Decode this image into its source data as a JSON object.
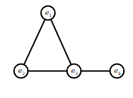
{
  "diagram": {
    "type": "undirected-graph",
    "nodes": [
      {
        "id": "e1",
        "base": "e",
        "sub": "1",
        "cx": 48,
        "cy": 13,
        "r": 7
      },
      {
        "id": "e2",
        "base": "e",
        "sub": "2",
        "cx": 21,
        "cy": 71,
        "r": 7
      },
      {
        "id": "e3",
        "base": "e",
        "sub": "3",
        "cx": 74,
        "cy": 71,
        "r": 7
      },
      {
        "id": "e4",
        "base": "e",
        "sub": "4",
        "cx": 117,
        "cy": 71,
        "r": 7
      }
    ],
    "edges": [
      {
        "from": "e1",
        "to": "e2"
      },
      {
        "from": "e1",
        "to": "e3"
      },
      {
        "from": "e2",
        "to": "e3"
      },
      {
        "from": "e3",
        "to": "e4"
      }
    ],
    "colors": {
      "stroke": "#111111",
      "fill": "#ffffff",
      "text": "#222222"
    }
  }
}
